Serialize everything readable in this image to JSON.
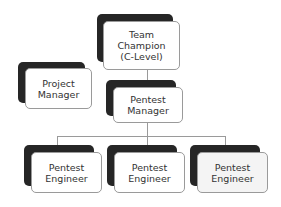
{
  "diagram": {
    "type": "org-chart",
    "nodes": [
      {
        "id": "team-champion",
        "label": "Team\nChampion\n(C-Level)"
      },
      {
        "id": "project-manager",
        "label": "Project\nManager"
      },
      {
        "id": "pentest-manager",
        "label": "Pentest\nManager"
      },
      {
        "id": "pentest-engineer-1",
        "label": "Pentest\nEngineer"
      },
      {
        "id": "pentest-engineer-2",
        "label": "Pentest\nEngineer"
      },
      {
        "id": "pentest-engineer-3",
        "label": "Pentest\nEngineer"
      }
    ],
    "edges": [
      {
        "from": "team-champion",
        "to": "pentest-manager"
      },
      {
        "from": "pentest-manager",
        "to": "pentest-engineer-1"
      },
      {
        "from": "pentest-manager",
        "to": "pentest-engineer-2"
      },
      {
        "from": "pentest-manager",
        "to": "pentest-engineer-3"
      }
    ],
    "colors": {
      "shadow": "#262626",
      "box": "#ffffff",
      "border": "#9a9a9a",
      "text": "#333333"
    }
  }
}
